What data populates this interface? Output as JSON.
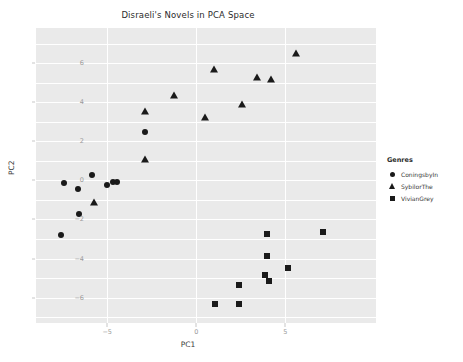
{
  "chart_data": {
    "type": "scatter",
    "title": "Disraeli's Novels in PCA Space",
    "xlabel": "PC1",
    "ylabel": "PC2",
    "xlim": [
      -9.0,
      10.1
    ],
    "ylim": [
      -7.3,
      7.8
    ],
    "xticks": [
      -5,
      0,
      5
    ],
    "yticks": [
      6,
      4,
      2,
      0,
      -2,
      -4,
      -6
    ],
    "grid": true,
    "legend_title": "Genres",
    "legend_position": "right",
    "series": [
      {
        "name": "ConingsbyIn",
        "marker": "circle",
        "color": "#1a1a1a",
        "points": [
          [
            -7.45,
            -0.14
          ],
          [
            -6.65,
            -0.43
          ],
          [
            -5.85,
            0.28
          ],
          [
            -5.0,
            -0.26
          ],
          [
            -4.7,
            -0.1
          ],
          [
            -4.45,
            -0.06
          ],
          [
            -6.6,
            -1.72
          ],
          [
            -7.6,
            -2.82
          ],
          [
            -2.85,
            2.47
          ]
        ]
      },
      {
        "name": "SybilorThe",
        "marker": "triangle",
        "color": "#1a1a1a",
        "points": [
          [
            -5.75,
            -1.12
          ],
          [
            -2.9,
            1.12
          ],
          [
            -2.9,
            3.53
          ],
          [
            -1.25,
            4.35
          ],
          [
            0.5,
            3.22
          ],
          [
            1.0,
            5.68
          ],
          [
            2.55,
            3.9
          ],
          [
            3.4,
            5.3
          ],
          [
            4.2,
            5.2
          ],
          [
            5.6,
            6.5
          ]
        ]
      },
      {
        "name": "VivianGrey",
        "marker": "square",
        "color": "#1a1a1a",
        "points": [
          [
            3.95,
            -2.73
          ],
          [
            7.1,
            -2.65
          ],
          [
            3.95,
            -3.85
          ],
          [
            3.85,
            -4.82
          ],
          [
            5.15,
            -4.5
          ],
          [
            4.1,
            -5.15
          ],
          [
            2.4,
            -5.35
          ],
          [
            1.05,
            -6.32
          ],
          [
            2.4,
            -6.35
          ]
        ]
      }
    ]
  }
}
